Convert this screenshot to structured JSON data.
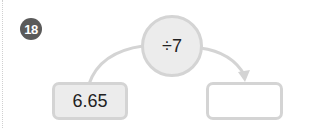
{
  "problem": {
    "number": "18",
    "operator_label": "÷7",
    "input_value": "6.65",
    "answer_value": ""
  },
  "colors": {
    "badge": "#5a5a5a",
    "border": "#d4d4d4",
    "fill": "#ececec"
  }
}
